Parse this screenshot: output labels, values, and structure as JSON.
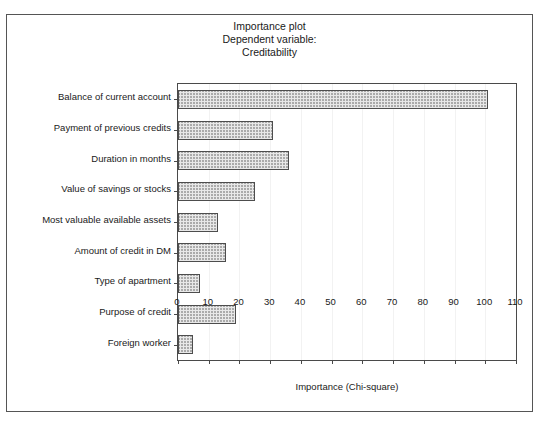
{
  "chart_data": {
    "type": "bar",
    "orientation": "horizontal",
    "title": "Importance plot",
    "subtitle_lines": [
      "Dependent variable:",
      "Creditability"
    ],
    "xlabel": "Importance (Chi-square)",
    "ylabel": "",
    "xlim": [
      0,
      110
    ],
    "xticks": [
      0,
      10,
      20,
      30,
      40,
      50,
      60,
      70,
      80,
      90,
      100,
      110
    ],
    "grid": true,
    "legend": null,
    "categories": [
      "Balance of current account",
      "Payment of previous credits",
      "Duration in months",
      "Value of savings or stocks",
      "Most valuable available assets",
      "Amount of credit in DM",
      "Type of apartment",
      "Purpose of credit",
      "Foreign worker"
    ],
    "values": [
      101,
      31,
      36,
      25,
      13,
      15.5,
      7,
      19,
      5
    ],
    "bar_fill": "#e8e8e8",
    "bar_edge": "#4d4d4d",
    "bar_pattern": "crosshatch"
  },
  "figure": {
    "title_line1": "Importance plot",
    "title_line2": "Dependent variable:",
    "title_line3": "Creditability",
    "x_axis_title": "Importance (Chi-square)"
  }
}
